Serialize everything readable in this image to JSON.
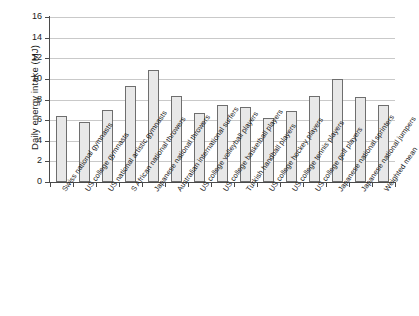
{
  "chart_data": {
    "type": "bar",
    "title": "",
    "xlabel": "",
    "ylabel": "Daily energy intake (MJ)",
    "ylim": [
      0,
      16
    ],
    "yticks": [
      0,
      2,
      4,
      6,
      8,
      10,
      12,
      14,
      16
    ],
    "grid": true,
    "legend": false,
    "categories": [
      "Swiss national gymnasts",
      "US college gymnasts",
      "US national artistic gymnasts",
      "S African national throwers",
      "Japanese national throwers",
      "Australian international surfers",
      "US college volleyball players",
      "US college basketball players",
      "Turkish handball players",
      "US college hockey players",
      "US college tennis players",
      "US college golf players",
      "Japanese national sprinters",
      "Japanese national jumpers",
      "Weighted mean"
    ],
    "values": [
      6.4,
      5.8,
      7.0,
      9.3,
      10.9,
      8.35,
      6.7,
      7.5,
      7.25,
      6.2,
      6.9,
      8.35,
      9.95,
      8.2,
      7.45
    ],
    "bar_fill_color": "#e8e8e8",
    "bar_edge_color": "#6e6e6e",
    "gridline_color": "#c9c9c9",
    "axis_color": "#4a4a4a"
  }
}
